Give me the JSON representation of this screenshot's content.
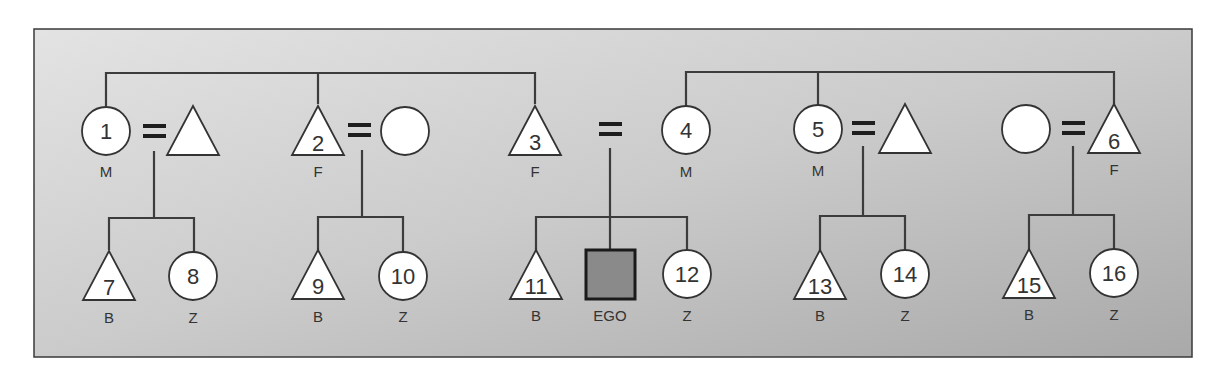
{
  "diagram": {
    "title": "",
    "colors": {
      "frame_bg_start": "#e2e2e2",
      "frame_bg_end": "#acacac",
      "line": "#3c3c3c",
      "symbol_fill": "#ffffff",
      "ego_fill": "#8a8a8a"
    },
    "frame": {
      "x": 34,
      "y": 29,
      "w": 1158,
      "h": 328
    },
    "parent_generation": [
      {
        "id": 1,
        "number": "1",
        "shape": "circle",
        "label": "M",
        "cx": 106,
        "cy": 131
      },
      {
        "id": "s1",
        "number": "",
        "shape": "triangle",
        "label": "",
        "cx": 193,
        "cy": 129
      },
      {
        "id": 2,
        "number": "2",
        "shape": "triangle",
        "label": "F",
        "cx": 318,
        "cy": 129
      },
      {
        "id": "s2",
        "number": "",
        "shape": "circle",
        "label": "",
        "cx": 405,
        "cy": 131
      },
      {
        "id": 3,
        "number": "3",
        "shape": "triangle",
        "label": "F",
        "cx": 535,
        "cy": 129
      },
      {
        "id": 4,
        "number": "4",
        "shape": "circle",
        "label": "M",
        "cx": 686,
        "cy": 131
      },
      {
        "id": 5,
        "number": "5",
        "shape": "circle",
        "label": "M",
        "cx": 818,
        "cy": 131
      },
      {
        "id": "s5",
        "number": "",
        "shape": "triangle",
        "label": "",
        "cx": 905,
        "cy": 129
      },
      {
        "id": "s6",
        "number": "",
        "shape": "circle",
        "label": "",
        "cx": 1026,
        "cy": 129
      },
      {
        "id": 6,
        "number": "6",
        "shape": "triangle",
        "label": "F",
        "cx": 1114,
        "cy": 129
      }
    ],
    "marriages": [
      {
        "x": 155,
        "y": 131
      },
      {
        "x": 360,
        "y": 131
      },
      {
        "x": 617,
        "y": 130
      },
      {
        "x": 864,
        "y": 129
      },
      {
        "x": 1073,
        "y": 129
      }
    ],
    "children_generation": [
      {
        "id": 7,
        "number": "7",
        "shape": "triangle",
        "label": "B",
        "cx": 109,
        "cy": 277
      },
      {
        "id": 8,
        "number": "8",
        "shape": "circle",
        "label": "Z",
        "cx": 194,
        "cy": 277
      },
      {
        "id": 9,
        "number": "9",
        "shape": "triangle",
        "label": "B",
        "cx": 318,
        "cy": 277
      },
      {
        "id": 10,
        "number": "10",
        "shape": "circle",
        "label": "Z",
        "cx": 403,
        "cy": 277
      },
      {
        "id": 11,
        "number": "11",
        "shape": "triangle",
        "label": "B",
        "cx": 536,
        "cy": 277
      },
      {
        "id": "ego",
        "number": "",
        "shape": "square",
        "label": "EGO",
        "cx": 610,
        "cy": 275
      },
      {
        "id": 12,
        "number": "12",
        "shape": "circle",
        "label": "Z",
        "cx": 687,
        "cy": 275
      },
      {
        "id": 13,
        "number": "13",
        "shape": "triangle",
        "label": "B",
        "cx": 820,
        "cy": 277
      },
      {
        "id": 14,
        "number": "14",
        "shape": "circle",
        "label": "Z",
        "cx": 905,
        "cy": 275
      },
      {
        "id": 15,
        "number": "15",
        "shape": "triangle",
        "label": "B",
        "cx": 1029,
        "cy": 275
      },
      {
        "id": 16,
        "number": "16",
        "shape": "circle",
        "label": "Z",
        "cx": 1114,
        "cy": 274
      }
    ],
    "labels": {
      "n1": "1",
      "n2": "2",
      "n3": "3",
      "n4": "4",
      "n5": "5",
      "n6": "6",
      "n7": "7",
      "n8": "8",
      "n9": "9",
      "n10": "10",
      "n11": "11",
      "n12": "12",
      "n13": "13",
      "n14": "14",
      "n15": "15",
      "n16": "16",
      "M": "M",
      "F": "F",
      "B": "B",
      "Z": "Z",
      "EGO": "EGO"
    }
  }
}
